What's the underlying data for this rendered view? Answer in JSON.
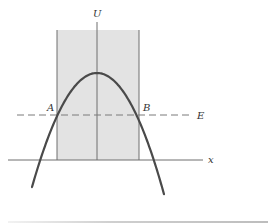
{
  "figure": {
    "axes": {
      "vertical_label": "U",
      "horizontal_label": "x",
      "origin_x": 97,
      "baseline_y": 160,
      "x_axis_start": 8,
      "x_axis_end": 203,
      "u_axis_top": 22
    },
    "energy_line": {
      "label": "E",
      "y": 115,
      "x_start": 17,
      "x_end": 193,
      "dash": "7 4"
    },
    "points": [
      {
        "label": "A",
        "x": 57,
        "y": 115,
        "label_x": 47,
        "label_y": 111
      },
      {
        "label": "B",
        "x": 139,
        "y": 115,
        "label_x": 143,
        "label_y": 111
      }
    ],
    "shaded_region": {
      "x0": 57,
      "x1": 139,
      "y_top": 30,
      "y_bottom": 160
    },
    "curve": {
      "type": "inverted-parabola",
      "peak_x": 97,
      "peak_y": 73,
      "x_left": 32,
      "x_right": 164,
      "stretch": 0.027
    },
    "colors": {
      "shade": "#e3e3e3",
      "curve": "#4a4a4a",
      "axis": "#6e6e6e",
      "dash": "#7a7a7a",
      "label": "#333333"
    }
  }
}
